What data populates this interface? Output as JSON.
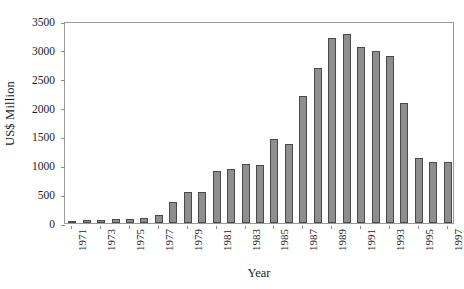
{
  "chart_data": {
    "type": "bar",
    "title": "",
    "xlabel": "Year",
    "ylabel": "US$ Million",
    "ylim": [
      0,
      3500
    ],
    "ytick_step": 500,
    "yticks": [
      0,
      500,
      1000,
      1500,
      2000,
      2500,
      3000,
      3500
    ],
    "ytick_labels": [
      "0",
      "500",
      "1000",
      "1500",
      "2000",
      "2500",
      "3000",
      "3500"
    ],
    "grid": false,
    "legend": false,
    "bar_color": "#8e8e8e",
    "bar_edge_color": "#4a4a4a",
    "axis_color": "#9a9a9a",
    "categories": [
      "1971",
      "1972",
      "1973",
      "1974",
      "1975",
      "1976",
      "1977",
      "1978",
      "1979",
      "1980",
      "1981",
      "1982",
      "1983",
      "1984",
      "1985",
      "1986",
      "1987",
      "1988",
      "1989",
      "1990",
      "1991",
      "1992",
      "1993",
      "1994",
      "1995",
      "1996",
      "1997"
    ],
    "values": [
      20,
      45,
      60,
      70,
      75,
      80,
      140,
      370,
      540,
      540,
      900,
      940,
      1020,
      1010,
      1450,
      1370,
      2200,
      2680,
      3200,
      3280,
      3050,
      2980,
      2890,
      2080,
      1120,
      1050,
      1060
    ],
    "xtick_labels": [
      "1971",
      "1973",
      "1975",
      "1977",
      "1979",
      "1981",
      "1983",
      "1985",
      "1987",
      "1989",
      "1991",
      "1993",
      "1995",
      "1997"
    ],
    "xtick_categories": [
      "1971",
      "1973",
      "1975",
      "1977",
      "1979",
      "1981",
      "1983",
      "1985",
      "1987",
      "1989",
      "1991",
      "1993",
      "1995",
      "1997"
    ]
  }
}
